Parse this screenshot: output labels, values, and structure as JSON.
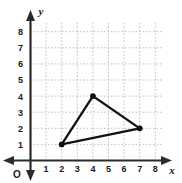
{
  "chart_data": {
    "type": "scatter",
    "title": "",
    "xlabel": "x",
    "ylabel": "y",
    "grid": true,
    "legend": null,
    "xlim": [
      0,
      8.6
    ],
    "ylim": [
      0,
      8.6
    ],
    "xticks": [
      1,
      2,
      3,
      4,
      5,
      6,
      7,
      8
    ],
    "yticks": [
      1,
      2,
      3,
      4,
      5,
      6,
      7,
      8
    ],
    "origin_label": "O",
    "annotations": [],
    "series": [
      {
        "name": "triangle",
        "shape": "polygon",
        "closed": true,
        "color": "#111111",
        "points": [
          {
            "x": 2,
            "y": 1
          },
          {
            "x": 4,
            "y": 4
          },
          {
            "x": 7,
            "y": 2
          }
        ]
      }
    ]
  },
  "axes": {
    "x_name": "x",
    "y_name": "y",
    "origin": "O",
    "x_tick_labels": [
      "1",
      "2",
      "3",
      "4",
      "5",
      "6",
      "7",
      "8"
    ],
    "y_tick_labels": [
      "1",
      "2",
      "3",
      "4",
      "5",
      "6",
      "7",
      "8"
    ]
  },
  "colors": {
    "background": "#ffffff",
    "grid": "#b9b9b9",
    "axis": "#2b2b2b",
    "shape": "#111111",
    "text": "#1a1a1a"
  }
}
